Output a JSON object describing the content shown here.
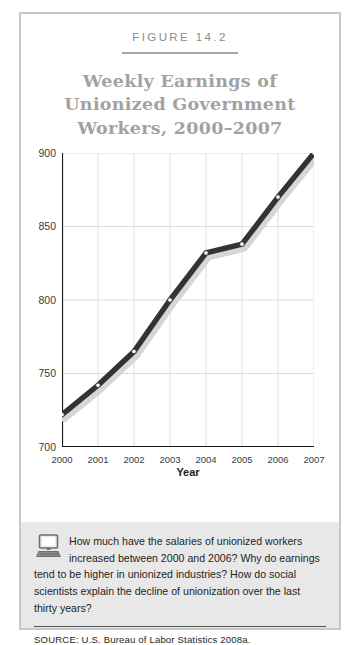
{
  "figure": {
    "number": "FIGURE 14.2",
    "title_lines": [
      "Weekly Earnings of",
      "Unionized Government",
      "Workers, 2000–2007"
    ],
    "title_full": "Weekly Earnings of Unionized Government Workers, 2000–2007"
  },
  "chart_data": {
    "type": "line",
    "title": "Weekly Earnings of Unionized Government Workers, 2000–2007",
    "xlabel": "Year",
    "ylabel": "",
    "categories": [
      "2000",
      "2001",
      "2002",
      "2003",
      "2004",
      "2005",
      "2006",
      "2007"
    ],
    "x": [
      2000,
      2001,
      2002,
      2003,
      2004,
      2005,
      2006,
      2007
    ],
    "values": [
      722,
      742,
      765,
      800,
      832,
      838,
      870,
      900
    ],
    "series": [
      {
        "name": "Weekly earnings",
        "values": [
          722,
          742,
          765,
          800,
          832,
          838,
          870,
          900
        ]
      }
    ],
    "ylim": [
      700,
      900
    ],
    "xlim": [
      2000,
      2007
    ],
    "yticks": [
      700,
      750,
      800,
      850,
      900
    ],
    "ytick_labels": [
      "700",
      "750",
      "800",
      "850",
      "900"
    ],
    "xticks": [
      2000,
      2001,
      2002,
      2003,
      2004,
      2005,
      2006,
      2007
    ],
    "xtick_labels": [
      "2000",
      "2001",
      "2002",
      "2003",
      "2004",
      "2005",
      "2006",
      "2007"
    ],
    "grid": true,
    "legend": false,
    "line_color": "#333333",
    "marker_fill": "#ffffff",
    "shadow_color": "#d6d6d6",
    "grid_color": "#dcdcdc",
    "axis_color": "#1a1a1a"
  },
  "question": {
    "text": "How much have the salaries of unionized workers increased between 2000 and 2006? Why do earnings tend to be higher in unionized industries? How do social scientists explain the decline of unionization over the last thirty years?",
    "icon": "computer-icon"
  },
  "source": {
    "label": "SOURCE:",
    "text": "U.S. Bureau of Labor Statistics 2008a.",
    "full": "SOURCE:  U.S. Bureau of Labor Statistics 2008a."
  },
  "colors": {
    "frame": "#c9c9c9",
    "title_text": "#a2a2a2",
    "question_background": "#e8e8e8"
  }
}
